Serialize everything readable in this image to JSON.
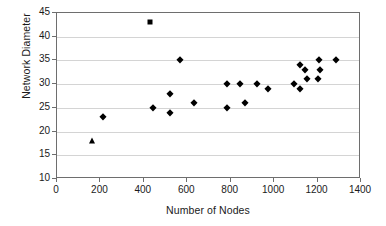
{
  "chart_data": {
    "type": "scatter",
    "title": "",
    "xlabel": "Number of Nodes",
    "ylabel": "Network Diameter",
    "xlim": [
      0,
      1400
    ],
    "ylim": [
      10,
      45
    ],
    "xticks": [
      0,
      200,
      400,
      600,
      800,
      1000,
      1200,
      1400
    ],
    "yticks": [
      10,
      15,
      20,
      25,
      30,
      35,
      40,
      45
    ],
    "grid": "horizontal",
    "legend": "none",
    "marker_color": "#000000",
    "series": [
      {
        "name": "Network diameter (diamond)",
        "marker": "diamond",
        "points": [
          {
            "x": 210,
            "y": 23
          },
          {
            "x": 440,
            "y": 25
          },
          {
            "x": 520,
            "y": 28
          },
          {
            "x": 520,
            "y": 24
          },
          {
            "x": 565,
            "y": 35
          },
          {
            "x": 630,
            "y": 26
          },
          {
            "x": 785,
            "y": 30
          },
          {
            "x": 785,
            "y": 25
          },
          {
            "x": 845,
            "y": 30
          },
          {
            "x": 865,
            "y": 26
          },
          {
            "x": 920,
            "y": 30
          },
          {
            "x": 970,
            "y": 29
          },
          {
            "x": 1090,
            "y": 30
          },
          {
            "x": 1120,
            "y": 34
          },
          {
            "x": 1120,
            "y": 29
          },
          {
            "x": 1140,
            "y": 33
          },
          {
            "x": 1150,
            "y": 31
          },
          {
            "x": 1205,
            "y": 35
          },
          {
            "x": 1210,
            "y": 33
          },
          {
            "x": 1200,
            "y": 31
          },
          {
            "x": 1285,
            "y": 35
          }
        ]
      },
      {
        "name": "Outlier (square)",
        "marker": "square",
        "points": [
          {
            "x": 430,
            "y": 43
          }
        ]
      },
      {
        "name": "Low outlier (triangle)",
        "marker": "triangle",
        "points": [
          {
            "x": 162,
            "y": 18
          }
        ]
      }
    ]
  }
}
